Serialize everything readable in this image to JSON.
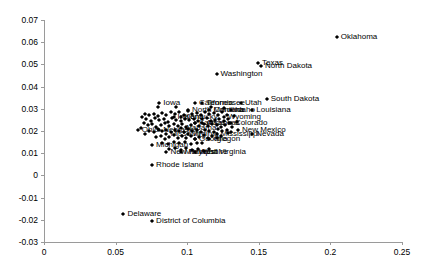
{
  "chart_data": {
    "type": "scatter",
    "title": "",
    "xlabel": "",
    "ylabel": "",
    "xlim": [
      0,
      0.25
    ],
    "ylim": [
      -0.03,
      0.07
    ],
    "grid": false,
    "legend": null,
    "xticks": [
      "0",
      "0.05",
      "0.1",
      "0.15",
      "0.2",
      "0.25"
    ],
    "xtick_values": [
      0,
      0.05,
      0.1,
      0.15,
      0.2,
      0.25
    ],
    "yticks": [
      "0.07",
      "0.06",
      "0.05",
      "0.04",
      "0.03",
      "0.02",
      "0.01",
      "0",
      "-0.01",
      "-0.02",
      "-0.03"
    ],
    "ytick_values": [
      0.07,
      0.06,
      0.05,
      0.04,
      0.03,
      0.02,
      0.01,
      0,
      -0.01,
      -0.02,
      -0.03
    ],
    "marker": "diamond",
    "marker_color": "#000000",
    "points": [
      {
        "label": "Oklahoma",
        "x": 0.2045,
        "y": 0.0625,
        "label_side": "right"
      },
      {
        "label": "Texas",
        "x": 0.1495,
        "y": 0.0505,
        "label_side": "right"
      },
      {
        "label": "North Dakota",
        "x": 0.1515,
        "y": 0.0495,
        "label_side": "right"
      },
      {
        "label": "Washington",
        "x": 0.1205,
        "y": 0.0455,
        "label_side": "right"
      },
      {
        "label": "South Dakota",
        "x": 0.1555,
        "y": 0.0345,
        "label_side": "right"
      },
      {
        "label": "Iowa",
        "x": 0.0805,
        "y": 0.0325,
        "label_side": "right"
      },
      {
        "label": "California",
        "x": 0.1055,
        "y": 0.0325,
        "label_side": "right"
      },
      {
        "label": "Tennessee",
        "x": 0.1105,
        "y": 0.0325,
        "label_side": "right"
      },
      {
        "label": "Utah",
        "x": 0.1375,
        "y": 0.0325,
        "label_side": "right"
      },
      {
        "label": "Louisiana",
        "x": 0.1455,
        "y": 0.0295,
        "label_side": "right"
      },
      {
        "label": "North Carolina",
        "x": 0.1005,
        "y": 0.0295,
        "label_side": "right"
      },
      {
        "label": "Montana",
        "x": 0.1155,
        "y": 0.0295,
        "label_side": "right"
      },
      {
        "label": "Idaho",
        "x": 0.1305,
        "y": 0.0295,
        "label_side": "right"
      },
      {
        "label": "Wyoming",
        "x": 0.1255,
        "y": 0.0265,
        "label_side": "right"
      },
      {
        "label": "Kentucky",
        "x": 0.0955,
        "y": 0.0265,
        "label_side": "right"
      },
      {
        "label": "Indiana",
        "x": 0.0905,
        "y": 0.0265,
        "label_side": "right"
      },
      {
        "label": "Colorado",
        "x": 0.1305,
        "y": 0.0235,
        "label_side": "right"
      },
      {
        "label": "Arkansas",
        "x": 0.1105,
        "y": 0.0235,
        "label_side": "right"
      },
      {
        "label": "Kansas",
        "x": 0.1055,
        "y": 0.0235,
        "label_side": "right"
      },
      {
        "label": "Alabama",
        "x": 0.0955,
        "y": 0.0215,
        "label_side": "right"
      },
      {
        "label": "New Mexico",
        "x": 0.1355,
        "y": 0.0205,
        "label_side": "right"
      },
      {
        "label": "Nevada",
        "x": 0.1455,
        "y": 0.0185,
        "label_side": "right"
      },
      {
        "label": "Mississippi",
        "x": 0.1205,
        "y": 0.0185,
        "label_side": "right"
      },
      {
        "label": "Ohio",
        "x": 0.0655,
        "y": 0.0205,
        "label_side": "right"
      },
      {
        "label": "Nebraska",
        "x": 0.0805,
        "y": 0.0205,
        "label_side": "right"
      },
      {
        "label": "Missouri",
        "x": 0.0855,
        "y": 0.0185,
        "label_side": "right"
      },
      {
        "label": "Virginia",
        "x": 0.1005,
        "y": 0.0185,
        "label_side": "right"
      },
      {
        "label": "Georgia",
        "x": 0.1055,
        "y": 0.0165,
        "label_side": "right"
      },
      {
        "label": "Oregon",
        "x": 0.1155,
        "y": 0.0165,
        "label_side": "right"
      },
      {
        "label": "Michigan",
        "x": 0.0755,
        "y": 0.0135,
        "label_side": "right"
      },
      {
        "label": "New Hampshire",
        "x": 0.0855,
        "y": 0.0105,
        "label_side": "right"
      },
      {
        "label": "West Virginia",
        "x": 0.1055,
        "y": 0.0105,
        "label_side": "right"
      },
      {
        "label": "Maryland",
        "x": 0.0955,
        "y": 0.0105,
        "label_side": "right"
      },
      {
        "label": "Rhode Island",
        "x": 0.0755,
        "y": 0.0045,
        "label_side": "right"
      },
      {
        "label": "Delaware",
        "x": 0.0555,
        "y": -0.0175,
        "label_side": "right"
      },
      {
        "label": "District of Columbia",
        "x": 0.0755,
        "y": -0.0205,
        "label_side": "right"
      }
    ],
    "cluster_points": [
      [
        0.0705,
        0.0275
      ],
      [
        0.0735,
        0.0272
      ],
      [
        0.0765,
        0.0278
      ],
      [
        0.0795,
        0.0268
      ],
      [
        0.0825,
        0.0282
      ],
      [
        0.0855,
        0.0274
      ],
      [
        0.0885,
        0.0286
      ],
      [
        0.0915,
        0.0276
      ],
      [
        0.0945,
        0.0284
      ],
      [
        0.0975,
        0.0272
      ],
      [
        0.1005,
        0.0288
      ],
      [
        0.1035,
        0.0278
      ],
      [
        0.1065,
        0.0282
      ],
      [
        0.1095,
        0.027
      ],
      [
        0.1125,
        0.0286
      ],
      [
        0.1155,
        0.0276
      ],
      [
        0.1185,
        0.028
      ],
      [
        0.1215,
        0.0272
      ],
      [
        0.1245,
        0.0284
      ],
      [
        0.1275,
        0.0274
      ],
      [
        0.0715,
        0.0252
      ],
      [
        0.0745,
        0.0245
      ],
      [
        0.0775,
        0.0258
      ],
      [
        0.0805,
        0.0248
      ],
      [
        0.0835,
        0.0255
      ],
      [
        0.0865,
        0.0242
      ],
      [
        0.0895,
        0.0258
      ],
      [
        0.0925,
        0.025
      ],
      [
        0.0955,
        0.0244
      ],
      [
        0.0985,
        0.0256
      ],
      [
        0.1015,
        0.0248
      ],
      [
        0.1045,
        0.0254
      ],
      [
        0.1075,
        0.0246
      ],
      [
        0.1105,
        0.0252
      ],
      [
        0.1135,
        0.0258
      ],
      [
        0.1165,
        0.0244
      ],
      [
        0.1195,
        0.025
      ],
      [
        0.1225,
        0.0256
      ],
      [
        0.1255,
        0.0246
      ],
      [
        0.1285,
        0.0252
      ],
      [
        0.0725,
        0.0226
      ],
      [
        0.0755,
        0.0232
      ],
      [
        0.0785,
        0.022
      ],
      [
        0.0815,
        0.0228
      ],
      [
        0.0845,
        0.0234
      ],
      [
        0.0875,
        0.0222
      ],
      [
        0.0905,
        0.023
      ],
      [
        0.0935,
        0.0224
      ],
      [
        0.0965,
        0.0232
      ],
      [
        0.0995,
        0.022
      ],
      [
        0.1025,
        0.0228
      ],
      [
        0.1055,
        0.0234
      ],
      [
        0.1085,
        0.0222
      ],
      [
        0.1115,
        0.023
      ],
      [
        0.1145,
        0.0224
      ],
      [
        0.1175,
        0.0232
      ],
      [
        0.1205,
        0.0226
      ],
      [
        0.1235,
        0.022
      ],
      [
        0.1265,
        0.0228
      ],
      [
        0.1295,
        0.0234
      ],
      [
        0.0735,
        0.0202
      ],
      [
        0.0765,
        0.0196
      ],
      [
        0.0795,
        0.0208
      ],
      [
        0.0825,
        0.0198
      ],
      [
        0.0855,
        0.0204
      ],
      [
        0.0885,
        0.0194
      ],
      [
        0.0915,
        0.0206
      ],
      [
        0.0945,
        0.02
      ],
      [
        0.0975,
        0.0196
      ],
      [
        0.1005,
        0.0208
      ],
      [
        0.1035,
        0.0198
      ],
      [
        0.1065,
        0.0204
      ],
      [
        0.1095,
        0.0194
      ],
      [
        0.1125,
        0.0206
      ],
      [
        0.1155,
        0.02
      ],
      [
        0.1185,
        0.0196
      ],
      [
        0.1215,
        0.0208
      ],
      [
        0.1245,
        0.0198
      ],
      [
        0.1275,
        0.0204
      ],
      [
        0.1305,
        0.0194
      ],
      [
        0.0785,
        0.0172
      ],
      [
        0.0815,
        0.0178
      ],
      [
        0.0845,
        0.0166
      ],
      [
        0.0875,
        0.0174
      ],
      [
        0.0905,
        0.018
      ],
      [
        0.0935,
        0.0168
      ],
      [
        0.0965,
        0.0176
      ],
      [
        0.0995,
        0.017
      ],
      [
        0.1025,
        0.0178
      ],
      [
        0.1055,
        0.0166
      ],
      [
        0.1085,
        0.0174
      ],
      [
        0.1115,
        0.018
      ],
      [
        0.1145,
        0.0168
      ],
      [
        0.1175,
        0.0176
      ],
      [
        0.1205,
        0.017
      ],
      [
        0.1235,
        0.0178
      ],
      [
        0.0825,
        0.0148
      ],
      [
        0.0865,
        0.0142
      ],
      [
        0.0905,
        0.0152
      ],
      [
        0.0945,
        0.0144
      ],
      [
        0.0985,
        0.015
      ],
      [
        0.1025,
        0.014
      ],
      [
        0.1065,
        0.0148
      ],
      [
        0.1105,
        0.0144
      ],
      [
        0.0875,
        0.0118
      ],
      [
        0.0915,
        0.0124
      ],
      [
        0.0955,
        0.0114
      ],
      [
        0.0995,
        0.0122
      ],
      [
        0.1035,
        0.0116
      ],
      [
        0.1075,
        0.012
      ],
      [
        0.1115,
        0.0112
      ],
      [
        0.1155,
        0.0118
      ],
      [
        0.0795,
        0.0306
      ],
      [
        0.0925,
        0.031
      ],
      [
        0.1165,
        0.0308
      ],
      [
        0.1255,
        0.0304
      ],
      [
        0.0685,
        0.0262
      ],
      [
        0.0695,
        0.0238
      ],
      [
        0.0675,
        0.0212
      ],
      [
        0.1325,
        0.0268
      ],
      [
        0.1345,
        0.0242
      ],
      [
        0.1315,
        0.0216
      ],
      [
        0.1285,
        0.0192
      ],
      [
        0.0705,
        0.0188
      ]
    ]
  }
}
